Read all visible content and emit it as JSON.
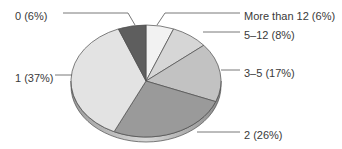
{
  "chart_data": {
    "type": "pie",
    "title": "",
    "three_d": true,
    "start_angle_deg": 0,
    "direction": "clockwise",
    "legend": "none (callout labels)",
    "slices": [
      {
        "label": "More than 12",
        "value": 6,
        "display": "More than 12 (6%)",
        "color": "#f2f2f2"
      },
      {
        "label": "5–12",
        "value": 8,
        "display": "5–12 (8%)",
        "color": "#d6d6d6"
      },
      {
        "label": "3–5",
        "value": 17,
        "display": "3–5 (17%)",
        "color": "#c2c2c2"
      },
      {
        "label": "2",
        "value": 26,
        "display": "2 (26%)",
        "color": "#9a9a9a"
      },
      {
        "label": "1",
        "value": 37,
        "display": "1 (37%)",
        "color": "#e3e3e3"
      },
      {
        "label": "0",
        "value": 6,
        "display": "0 (6%)",
        "color": "#5e5e5e"
      }
    ]
  },
  "labels": {
    "more_than_12": "More than 12 (6%)",
    "five_12": "5–12 (8%)",
    "three_5": "3–5 (17%)",
    "two": "2 (26%)",
    "one": "1 (37%)",
    "zero": "0 (6%)"
  },
  "colors": {
    "edge": "#4a4a4a",
    "leader": "#555555",
    "rim": "#b5b5b5"
  }
}
